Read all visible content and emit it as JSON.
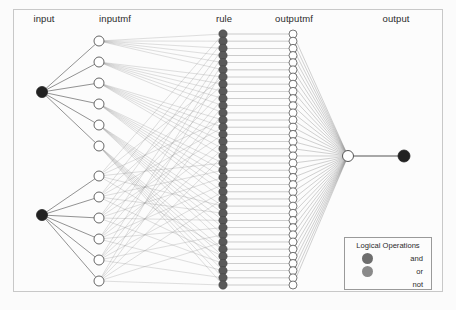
{
  "figure": {
    "background_color": "#fbfbfb",
    "frame_color": "#c8c8c8"
  },
  "column_labels": [
    {
      "key": "input",
      "text": "input",
      "x": 44,
      "y": 20
    },
    {
      "key": "inputmf",
      "text": "inputmf",
      "x": 115,
      "y": 20
    },
    {
      "key": "rule",
      "text": "rule",
      "x": 224,
      "y": 20
    },
    {
      "key": "outputmf",
      "text": "outputmf",
      "x": 294,
      "y": 20
    },
    {
      "key": "output",
      "text": "output",
      "x": 396,
      "y": 20
    }
  ],
  "legend": {
    "title": "Logical Operations",
    "items": [
      {
        "label": "and",
        "color": "#6e6e6e",
        "has_swatch": true
      },
      {
        "label": "or",
        "color": "#8a8a8a",
        "has_swatch": true
      },
      {
        "label": "not",
        "color": "#ffffff",
        "has_swatch": false
      }
    ]
  },
  "colors": {
    "node_dark": "#222222",
    "node_rule": "#5a5a5a",
    "node_open_fill": "#ffffff",
    "node_open_stroke": "#555555",
    "edge": "#8e8e8e",
    "edge_strong": "#4a4a4a",
    "text": "#2b2b2b"
  },
  "chart_data": {
    "type": "diagram",
    "layers": [
      {
        "name": "input",
        "node_count": 2,
        "style": "filled-dark",
        "radius": 5.5,
        "x": 42,
        "nodes": [
          {
            "id": "in1",
            "y": 92
          },
          {
            "id": "in2",
            "y": 215
          }
        ]
      },
      {
        "name": "inputmf",
        "node_count": 12,
        "style": "open",
        "radius": 5.0,
        "x": 99,
        "nodes": [
          {
            "id": "mf1",
            "y": 41,
            "group": 1
          },
          {
            "id": "mf2",
            "y": 62,
            "group": 1
          },
          {
            "id": "mf3",
            "y": 83,
            "group": 1
          },
          {
            "id": "mf4",
            "y": 104,
            "group": 1
          },
          {
            "id": "mf5",
            "y": 125,
            "group": 1
          },
          {
            "id": "mf6",
            "y": 146,
            "group": 1
          },
          {
            "id": "mf7",
            "y": 176,
            "group": 2
          },
          {
            "id": "mf8",
            "y": 197,
            "group": 2
          },
          {
            "id": "mf9",
            "y": 218,
            "group": 2
          },
          {
            "id": "mf10",
            "y": 239,
            "group": 2
          },
          {
            "id": "mf11",
            "y": 260,
            "group": 2
          },
          {
            "id": "mf12",
            "y": 281,
            "group": 2
          }
        ]
      },
      {
        "name": "rule",
        "node_count": 36,
        "style": "filled-gray",
        "radius": 4.2,
        "x": 223,
        "y_start": 34,
        "y_end": 285
      },
      {
        "name": "outputmf",
        "node_count": 36,
        "style": "open",
        "radius": 4.0,
        "x": 293,
        "y_start": 34,
        "y_end": 285
      },
      {
        "name": "aggregate",
        "node_count": 1,
        "style": "open",
        "radius": 5.5,
        "x": 348,
        "nodes": [
          {
            "id": "agg",
            "y": 156
          }
        ]
      },
      {
        "name": "output",
        "node_count": 1,
        "style": "filled-dark",
        "radius": 6.0,
        "x": 404,
        "nodes": [
          {
            "id": "out1",
            "y": 156
          }
        ]
      }
    ],
    "connections": [
      {
        "from": "input",
        "to": "inputmf",
        "pattern": "group-fanout",
        "note": "input 1 -> inputmf nodes 1-6; input 2 -> inputmf nodes 7-12"
      },
      {
        "from": "inputmf",
        "to": "rule",
        "pattern": "full-mesh",
        "note": "each inputmf node connects to a subset of the 36 rule nodes"
      },
      {
        "from": "rule",
        "to": "outputmf",
        "pattern": "one-to-one",
        "note": "rule i -> outputmf i"
      },
      {
        "from": "outputmf",
        "to": "aggregate",
        "pattern": "fan-in",
        "note": "all outputmf nodes converge on aggregation node"
      },
      {
        "from": "aggregate",
        "to": "output",
        "pattern": "single-edge"
      }
    ]
  }
}
